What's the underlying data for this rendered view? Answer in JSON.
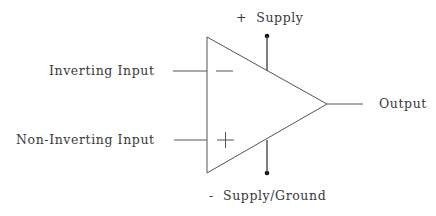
{
  "diagram": {
    "labels": {
      "positive_supply": "+  Supply",
      "negative_supply": "-  Supply/Ground",
      "inverting_input": "Inverting Input",
      "non_inverting_input": "Non-Inverting Input",
      "output": "Output"
    },
    "symbols": {
      "inverting_sign": "minus-sign",
      "non_inverting_sign": "plus-sign"
    },
    "colors": {
      "line": "#555555",
      "text": "#3a3a3a",
      "terminal_dot": "#111111",
      "background": "#ffffff"
    }
  }
}
